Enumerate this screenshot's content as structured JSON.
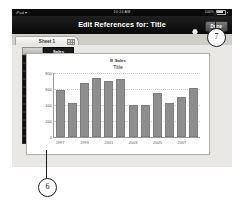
{
  "status_bar": {
    "left_text": "iPad",
    "wifi_icon": "wifi-icon",
    "time": "10:24 AM",
    "battery_text": "100%",
    "battery_icon": "battery-icon"
  },
  "toolbar": {
    "title": "Edit References for: Title",
    "gear_icon": "gear-icon",
    "done_label": "Done"
  },
  "tabs": {
    "sheet1_label": "Sheet 1",
    "grid_icon": "grid-icon"
  },
  "sheet": {
    "corner_label": "",
    "column_header": "Sales",
    "rows": [
      {
        "year": "1997",
        "value": "587"
      },
      {
        "year": "1998",
        "value": "425"
      },
      {
        "year": "1999",
        "value": "680"
      },
      {
        "year": "2000",
        "value": "736"
      },
      {
        "year": "2001",
        "value": "701"
      },
      {
        "year": "2002",
        "value": "721"
      },
      {
        "year": "2003",
        "value": "398"
      },
      {
        "year": "2004",
        "value": "399"
      },
      {
        "year": "2005",
        "value": "551"
      },
      {
        "year": "2006",
        "value": "420"
      },
      {
        "year": "2007",
        "value": "503"
      },
      {
        "year": "2008",
        "value": "607"
      }
    ]
  },
  "callouts": {
    "six": "6",
    "seven": "7"
  },
  "chart_data": {
    "type": "bar",
    "title": "Title",
    "xlabel": "",
    "ylabel": "",
    "ylim": [
      0,
      800
    ],
    "yticks": [
      0,
      200,
      400,
      600,
      800
    ],
    "grid": true,
    "legend": [
      "Sales"
    ],
    "legend_position": "top-center",
    "categories": [
      "1997",
      "1998",
      "1999",
      "2000",
      "2001",
      "2002",
      "2003",
      "2004",
      "2005",
      "2006",
      "2007",
      "2008"
    ],
    "xtick_labels": [
      "1997",
      "1999",
      "2001",
      "2003",
      "2005",
      "2007"
    ],
    "series": [
      {
        "name": "Sales",
        "color": "#8e8e8e",
        "values": [
          587,
          425,
          680,
          736,
          701,
          721,
          398,
          399,
          551,
          420,
          503,
          607
        ]
      }
    ]
  }
}
